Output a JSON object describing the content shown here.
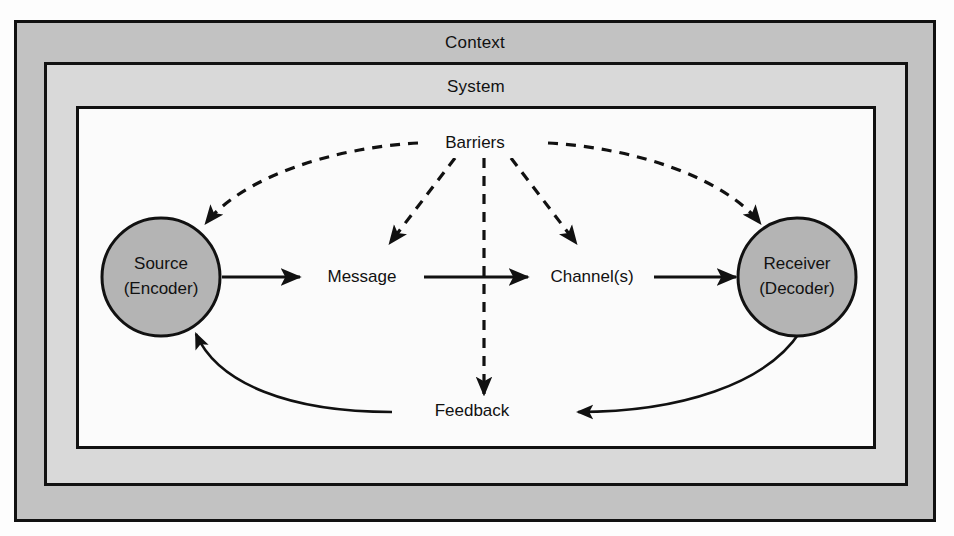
{
  "diagram": {
    "outer_box_label": "Context",
    "middle_box_label": "System",
    "nodes": {
      "source_line1": "Source",
      "source_line2": "(Encoder)",
      "message": "Message",
      "channel": "Channel(s)",
      "receiver_line1": "Receiver",
      "receiver_line2": "(Decoder)",
      "barriers": "Barriers",
      "feedback": "Feedback"
    },
    "colors": {
      "context_fill": "#c2c2c2",
      "system_fill": "#d9d9d9",
      "field_fill": "#fbfbfb",
      "node_fill": "#b4b4b4",
      "stroke": "#111111"
    },
    "flow": [
      "Source (Encoder)",
      "Message",
      "Channel(s)",
      "Receiver (Decoder)"
    ],
    "feedback_flow": [
      "Receiver (Decoder)",
      "Feedback",
      "Source (Encoder)"
    ],
    "barrier_targets": [
      "Source (Encoder)",
      "Message",
      "Feedback",
      "Channel(s)",
      "Receiver (Decoder)"
    ]
  }
}
